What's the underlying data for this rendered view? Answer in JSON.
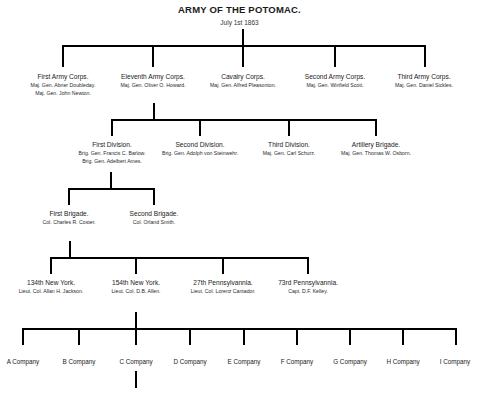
{
  "header": {
    "title": "ARMY OF THE POTOMAC.",
    "subtitle": "July 1st 1863"
  },
  "corps": [
    {
      "name": "First Army Corps.",
      "commanders": [
        "Maj. Gen. Abner Doubleday.",
        "Maj. Gen. John Newton."
      ]
    },
    {
      "name": "Eleventh Army Corps.",
      "commanders": [
        "Maj. Gen. Oliver O. Howard."
      ]
    },
    {
      "name": "Cavalry Corps.",
      "commanders": [
        "Maj. Gen. Alfred Pleasonton."
      ]
    },
    {
      "name": "Second Army Corps.",
      "commanders": [
        "Maj. Gen. Winfield Scott."
      ]
    },
    {
      "name": "Third Army Corps.",
      "commanders": [
        "Maj. Gen. Daniel Sickles."
      ]
    }
  ],
  "divisions": [
    {
      "name": "First Division.",
      "commanders": [
        "Brig. Gen. Francis C. Barlow.",
        "Brig. Gen. Adelbert Ames."
      ]
    },
    {
      "name": "Second Division.",
      "commanders": [
        "Brig. Gen. Adolph von Steinwehr."
      ]
    },
    {
      "name": "Third Division.",
      "commanders": [
        "Maj. Gen. Carl Schurz."
      ]
    },
    {
      "name": "Artillery Brigade.",
      "commanders": [
        "Maj. Gen. Thomas W. Osborn."
      ]
    }
  ],
  "brigades": [
    {
      "name": "First Brigade.",
      "commanders": [
        "Col. Charles R. Coster."
      ]
    },
    {
      "name": "Second Brigade.",
      "commanders": [
        "Col. Orland Smith."
      ]
    }
  ],
  "regiments": [
    {
      "name": "134th New York.",
      "commanders": [
        "Lieut. Col. Allan H. Jackson."
      ]
    },
    {
      "name": "154th New York.",
      "commanders": [
        "Lieut. Col. D.B. Allen."
      ]
    },
    {
      "name": "27th Pennsylvannia.",
      "commanders": [
        "Lieut. Col. Lorenz Cantador."
      ]
    },
    {
      "name": "73rd Pennsylvannia.",
      "commanders": [
        "Capt. D.F. Kelley."
      ]
    }
  ],
  "companies": [
    {
      "label": "A Company"
    },
    {
      "label": "B Company"
    },
    {
      "label": "C Company"
    },
    {
      "label": "D Company"
    },
    {
      "label": "E Company"
    },
    {
      "label": "F Company"
    },
    {
      "label": "G Company"
    },
    {
      "label": "H Company"
    },
    {
      "label": "I Company"
    }
  ],
  "colors": {
    "line": "#000000",
    "text": "#1a1a1a",
    "background": "#ffffff"
  }
}
